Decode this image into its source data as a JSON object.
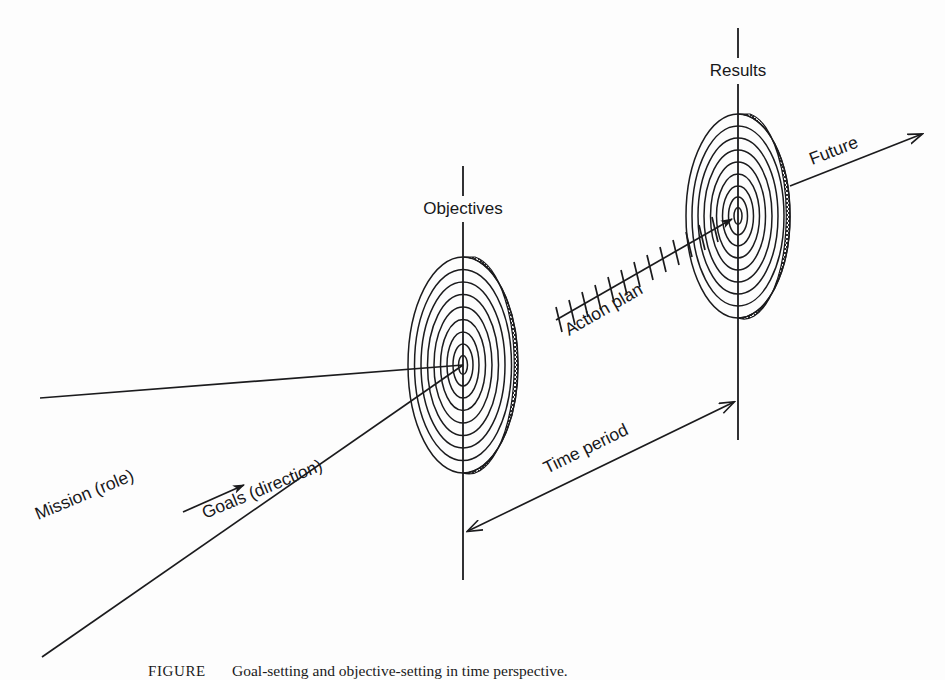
{
  "figure": {
    "background_color": "#fdfdfd",
    "ink_color": "#1b1b1d",
    "labels": {
      "objectives": "Objectives",
      "results": "Results",
      "action_plan": "Action plan",
      "future": "Future",
      "time_period": "Time period",
      "mission": "Mission (role)",
      "goals": "Goals (direction)"
    },
    "caption": {
      "lead": "FIGURE",
      "number": "",
      "text": "Goal-setting and objective-setting in time perspective."
    },
    "targets": [
      {
        "name": "objectives-target",
        "label": "Objectives",
        "center_x": 463,
        "center_y": 365,
        "outer_rx": 55,
        "outer_ry": 108,
        "ring_count": 9,
        "axis_top_y": 166,
        "axis_bottom_y": 580,
        "axis_gap_top": 196,
        "axis_gap_bottom": 222
      },
      {
        "name": "results-target",
        "label": "Results",
        "center_x": 738,
        "center_y": 216,
        "outer_rx": 52,
        "outer_ry": 102,
        "ring_count": 9,
        "axis_top_y": 28,
        "axis_bottom_y": 440,
        "axis_gap_top": 58,
        "axis_gap_bottom": 84
      }
    ],
    "connectors": [
      {
        "name": "mission-ray",
        "label": "Mission (role)",
        "from_x": 40,
        "from_y": 398,
        "to_x": 463,
        "to_y": 365
      },
      {
        "name": "goals-ray",
        "label": "Goals (direction)",
        "from_x": 42,
        "from_y": 657,
        "to_x": 463,
        "to_y": 365
      },
      {
        "name": "action-plan-arrow",
        "label": "Action plan",
        "from_x": 556,
        "from_y": 320,
        "to_x": 738,
        "to_y": 216,
        "tick_count": 13
      },
      {
        "name": "future-arrow",
        "label": "Future",
        "from_x": 790,
        "from_y": 185,
        "to_x": 925,
        "to_y": 133
      },
      {
        "name": "time-period-dimension",
        "label": "Time period",
        "from_x": 463,
        "from_y": 533,
        "to_x": 738,
        "to_y": 400
      },
      {
        "name": "goals-direction-arrow",
        "label": "",
        "from_x": 183,
        "from_y": 512,
        "to_x": 250,
        "to_y": 483
      }
    ]
  }
}
